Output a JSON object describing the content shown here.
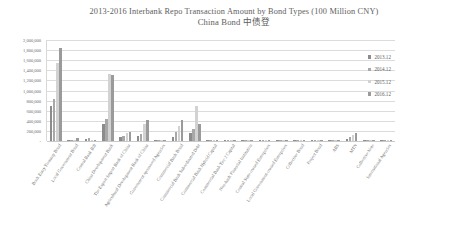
{
  "chart_data": {
    "type": "bar",
    "title": "2013-2016 Interbank Repo Transaction Amount by Bond Types (100 Million CNY)",
    "subtitle": "China Bond 中债登",
    "xlabel": "",
    "ylabel": "",
    "ylim": [
      0,
      2000000
    ],
    "grid": true,
    "legend_position": "right",
    "ytick_labels": [
      "2,000,000",
      "1,800,000",
      "1,600,000",
      "1,400,000",
      "1,200,000",
      "1,000,000",
      "800,000",
      "600,000",
      "400,000",
      "200,000",
      "-"
    ],
    "ytick_values": [
      2000000,
      1800000,
      1600000,
      1400000,
      1200000,
      1000000,
      800000,
      600000,
      400000,
      200000,
      0
    ],
    "categories": [
      "Book Entry Treasury Bond",
      "Local Government Bond",
      "Central Bank Bill",
      "China Development Bank",
      "The Export-Import Bank of China",
      "Agricultural Development Bank of China",
      "Government-sponsored Agencies",
      "Commercial Bank Bond",
      "Commercial Bank Subordinated Debt",
      "Commercial Bank Hybrid Capital",
      "Commercial Bank Tier 2 Capital",
      "Non-bank Financial Institution",
      "Central State-owned Enterprises",
      "Local Government-owned Enterprises",
      "Collective Bond",
      "Project Bond",
      "ABS",
      "MTN",
      "Collective Note",
      "International Agencies"
    ],
    "series": [
      {
        "name": "2013.12",
        "color": "#8c8c8c",
        "values": [
          700000,
          8000,
          42000,
          330000,
          70000,
          105000,
          3000,
          80000,
          150000,
          9000,
          2000,
          4000,
          7000,
          5000,
          800,
          600,
          2500,
          45000,
          1500,
          400
        ]
      },
      {
        "name": "2014.12",
        "color": "#a8a8a8",
        "values": [
          830000,
          12000,
          60000,
          440000,
          95000,
          140000,
          4000,
          175000,
          230000,
          11000,
          3500,
          6000,
          9000,
          7000,
          1000,
          800,
          3500,
          80000,
          2000,
          600
        ]
      },
      {
        "name": "2015.12",
        "color": "#d2d2d2",
        "values": [
          1550000,
          30000,
          28000,
          1320000,
          150000,
          330000,
          6000,
          300000,
          700000,
          14000,
          9000,
          12000,
          14000,
          11000,
          1400,
          1200,
          6000,
          120000,
          3000,
          900
        ]
      },
      {
        "name": "2016.12",
        "color": "#9a9a9a",
        "values": [
          1850000,
          55000,
          15000,
          1300000,
          175000,
          420000,
          7000,
          420000,
          330000,
          12000,
          30000,
          18000,
          20000,
          15000,
          1600,
          1400,
          9000,
          155000,
          3500,
          1200
        ]
      }
    ]
  },
  "legend": {
    "items": [
      {
        "label": "2013.12",
        "color": "#8c8c8c"
      },
      {
        "label": "2014.12",
        "color": "#a8a8a8"
      },
      {
        "label": "2015.12",
        "color": "#d2d2d2"
      },
      {
        "label": "2016.12",
        "color": "#9a9a9a"
      }
    ]
  }
}
